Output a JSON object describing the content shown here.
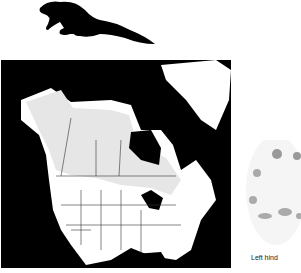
{
  "figure": {
    "animal_silhouette": "mink-silhouette",
    "map": {
      "region": "North America",
      "range_shading_color": "#e6e6e6",
      "land_color": "#ffffff",
      "water_color": "#000000"
    },
    "track": {
      "caption": "Left hind"
    }
  }
}
